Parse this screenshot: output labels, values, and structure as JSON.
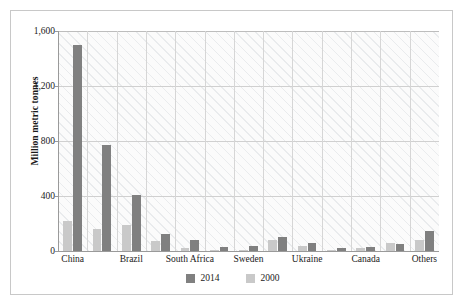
{
  "chart_data": {
    "type": "bar",
    "title": "",
    "xlabel": "",
    "ylabel": "Million metric tonnes",
    "ylim": [
      0,
      1600
    ],
    "yticks": [
      0,
      400,
      800,
      1200,
      1600
    ],
    "ytick_labels": [
      "0",
      "400",
      "800",
      "1,200",
      "1,600"
    ],
    "grid": "horizontal-and-vertical",
    "legend_position": "bottom-center",
    "categories": [
      "China",
      "",
      "Brazil",
      "",
      "South Africa",
      "",
      "Sweden",
      "",
      "Ukraine",
      "",
      "Canada",
      "",
      "Others"
    ],
    "visible_tick_labels": [
      "China",
      "Brazil",
      "South Africa",
      "Sweden",
      "Ukraine",
      "Canada",
      "Others"
    ],
    "series": [
      {
        "name": "2000",
        "color": "#c9c9c9",
        "values": [
          220,
          160,
          190,
          70,
          20,
          5,
          10,
          80,
          35,
          8,
          20,
          55,
          80
        ]
      },
      {
        "name": "2014",
        "color": "#808080",
        "values": [
          1500,
          770,
          410,
          125,
          80,
          30,
          35,
          100,
          55,
          22,
          32,
          52,
          145
        ]
      }
    ]
  },
  "legend": {
    "items": [
      {
        "label": "2014",
        "color": "#808080"
      },
      {
        "label": "2000",
        "color": "#c9c9c9"
      }
    ]
  }
}
